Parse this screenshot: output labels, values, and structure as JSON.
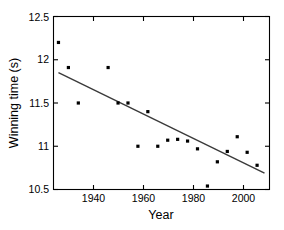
{
  "chart_data": {
    "type": "scatter",
    "title": "",
    "subtitle": "",
    "xlabel": "Year",
    "ylabel": "Winning time (s)",
    "xlim": [
      1926,
      2013
    ],
    "ylim": [
      10.5,
      12.5
    ],
    "grid": false,
    "legend": null,
    "xticks": [
      1940,
      1960,
      1980,
      2000
    ],
    "xtick_labels": [
      "1940",
      "1960",
      "1980",
      "2000"
    ],
    "yticks": [
      10.5,
      11,
      11.5,
      12,
      12.5
    ],
    "ytick_labels": [
      "10.5",
      "11",
      "11.5",
      "12",
      "12.5"
    ],
    "marker": "square",
    "marker_color": "#000000",
    "x": [
      1928,
      1932,
      1936,
      1948,
      1952,
      1956,
      1960,
      1964,
      1968,
      1972,
      1976,
      1980,
      1984,
      1988,
      1992,
      1996,
      2000,
      2004,
      2008
    ],
    "y": [
      12.2,
      11.91,
      11.5,
      11.91,
      11.5,
      11.5,
      11.0,
      11.4,
      11.0,
      11.07,
      11.08,
      11.06,
      10.97,
      10.54,
      10.82,
      10.94,
      11.11,
      10.93,
      10.78
    ],
    "series": [
      {
        "name": "Winning time",
        "values": [
          12.2,
          11.91,
          11.5,
          11.91,
          11.5,
          11.5,
          11.0,
          11.4,
          11.0,
          11.07,
          11.08,
          11.06,
          10.97,
          10.54,
          10.82,
          10.94,
          11.11,
          10.93,
          10.78
        ]
      }
    ],
    "trendline": {
      "type": "linear-fit",
      "color": "#3a3a3a",
      "x_start": 1928,
      "y_start": 11.85,
      "x_end": 2011,
      "y_end": 10.69
    },
    "annotations": []
  },
  "axes": {
    "x_label": "Year",
    "y_label": "Winning time (s)"
  }
}
